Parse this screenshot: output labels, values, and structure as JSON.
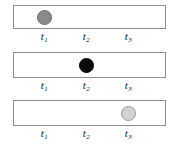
{
  "figure": {
    "width": 173,
    "height": 146,
    "background_color": "#ffffff",
    "track": {
      "border_color": "#8e8e8e",
      "fill_color": "#ffffff",
      "left": 13,
      "width": 153
    },
    "axis_labels": [
      {
        "text": "t",
        "subscript": "1",
        "center_x": 44
      },
      {
        "text": "t",
        "subscript": "2",
        "center_x": 86
      },
      {
        "text": "t",
        "subscript": "3",
        "center_x": 128
      }
    ],
    "panels": [
      {
        "id": "panel-1",
        "track_top": 5,
        "track_height": 24,
        "labels_top": 30,
        "ball": {
          "position_label": "t1",
          "center_x": 44,
          "center_y": 17,
          "diameter": 15,
          "style": "dark-gray",
          "fill_color": "#8a8a8a",
          "stroke_color": "#6b6b6b"
        }
      },
      {
        "id": "panel-2",
        "track_top": 52,
        "track_height": 26,
        "labels_top": 79,
        "ball": {
          "position_label": "t2",
          "center_x": 86,
          "center_y": 65,
          "diameter": 15,
          "style": "black",
          "fill_color": "#0b0b0b",
          "stroke_color": "#000000"
        }
      },
      {
        "id": "panel-3",
        "track_top": 100,
        "track_height": 26,
        "labels_top": 127,
        "ball": {
          "position_label": "t3",
          "center_x": 128,
          "center_y": 113,
          "diameter": 15,
          "style": "light-gray",
          "fill_color": "#d2d2d2",
          "stroke_color": "#9a9a9a"
        }
      }
    ]
  }
}
